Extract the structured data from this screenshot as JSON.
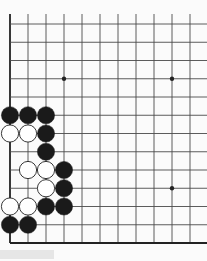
{
  "game": {
    "type": "go-board-fragment",
    "grid": {
      "origin_x": 10,
      "origin_y": 24,
      "col_spacing": 18,
      "row_spacing": 18.25,
      "cols": 11,
      "rows": 13,
      "left_edge": true,
      "bottom_edge": true,
      "right_edge": false,
      "top_edge": false
    },
    "colors": {
      "background": "#fbfbfb",
      "line": "#4a4a4a",
      "edge": "#222222",
      "black_stone": "#1a1a1a",
      "white_stone": "#ffffff",
      "white_stone_outline": "#222222"
    },
    "star_points": [
      {
        "col": 3,
        "row": 3
      },
      {
        "col": 9,
        "row": 3
      },
      {
        "col": 9,
        "row": 9
      }
    ],
    "stones": [
      {
        "col": 0,
        "row": 5,
        "color": "black"
      },
      {
        "col": 1,
        "row": 5,
        "color": "black"
      },
      {
        "col": 2,
        "row": 5,
        "color": "black"
      },
      {
        "col": 0,
        "row": 6,
        "color": "white"
      },
      {
        "col": 1,
        "row": 6,
        "color": "white"
      },
      {
        "col": 2,
        "row": 6,
        "color": "black"
      },
      {
        "col": 2,
        "row": 7,
        "color": "black"
      },
      {
        "col": 1,
        "row": 8,
        "color": "white"
      },
      {
        "col": 2,
        "row": 8,
        "color": "white"
      },
      {
        "col": 3,
        "row": 8,
        "color": "black"
      },
      {
        "col": 2,
        "row": 9,
        "color": "white"
      },
      {
        "col": 3,
        "row": 9,
        "color": "black"
      },
      {
        "col": 0,
        "row": 10,
        "color": "white"
      },
      {
        "col": 1,
        "row": 10,
        "color": "white"
      },
      {
        "col": 2,
        "row": 10,
        "color": "black"
      },
      {
        "col": 3,
        "row": 10,
        "color": "black"
      },
      {
        "col": 0,
        "row": 11,
        "color": "black"
      },
      {
        "col": 1,
        "row": 11,
        "color": "black"
      }
    ],
    "caption": ""
  }
}
